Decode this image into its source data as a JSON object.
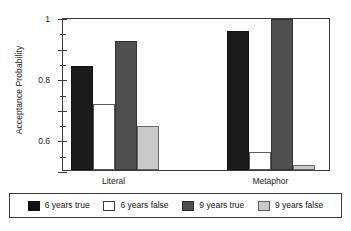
{
  "chart_data": {
    "type": "bar",
    "title": "",
    "xlabel": "",
    "ylabel": "Acceptance Probability",
    "categories": [
      "Literal",
      "Metaphor"
    ],
    "ylim": [
      0,
      1
    ],
    "yticks": [
      0,
      0.2,
      0.4,
      0.6,
      0.8,
      1
    ],
    "ytick_labels": [
      "0",
      "0.2",
      "0.4",
      "0.6",
      "0.8",
      "1"
    ],
    "yminor_ticks": [
      0.1,
      0.3,
      0.5,
      0.7,
      0.9
    ],
    "grid": false,
    "legend_position": "below",
    "series": [
      {
        "name": "6 years true",
        "color": "#111111",
        "values": [
          0.68,
          0.91
        ]
      },
      {
        "name": "6 years false",
        "color": "#ffffff",
        "values": [
          0.43,
          0.12
        ]
      },
      {
        "name": "9 years true",
        "color": "#4f4f4f",
        "values": [
          0.84,
          0.99
        ]
      },
      {
        "name": "9 years false",
        "color": "#c9c9c9",
        "values": [
          0.29,
          0.03
        ]
      }
    ]
  },
  "legend": {
    "entries": [
      {
        "label": "6 years true"
      },
      {
        "label": "6 years false"
      },
      {
        "label": "9 years true"
      },
      {
        "label": "9 years false"
      }
    ]
  }
}
